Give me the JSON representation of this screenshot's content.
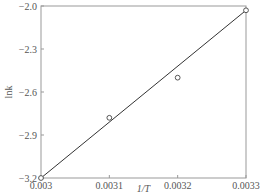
{
  "chart_data": {
    "type": "scatter",
    "title": "",
    "xlabel": "1/T",
    "ylabel": "lnk",
    "xlim": [
      0.003,
      0.0033
    ],
    "ylim": [
      -3.2,
      -2.0
    ],
    "x_ticks": [
      "0.003",
      "0.0031",
      "0.0032",
      "0.0033"
    ],
    "y_ticks": [
      "-2.0",
      "-2.3",
      "-2.6",
      "-2.9",
      "-3.2"
    ],
    "grid": false,
    "legend": null,
    "series": [
      {
        "name": "data",
        "marker": "open-circle",
        "x": [
          0.003,
          0.0031,
          0.0032,
          0.0033
        ],
        "y": [
          -3.2,
          -2.78,
          -2.5,
          -2.03
        ]
      },
      {
        "name": "linear fit",
        "style": "line",
        "x": [
          0.003,
          0.0033
        ],
        "y": [
          -3.2,
          -2.03
        ]
      }
    ]
  }
}
